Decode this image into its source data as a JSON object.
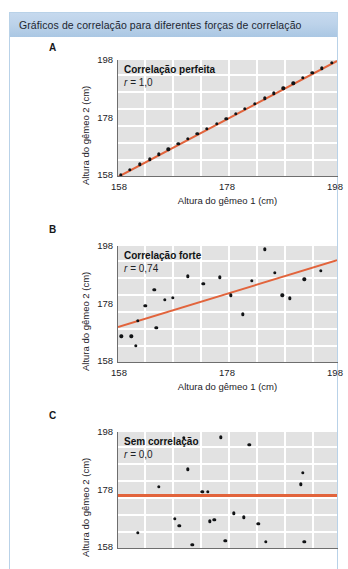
{
  "figure": {
    "title": "Gráficos de correlação para diferentes forças de correlação",
    "accent_band_color": "#bdd3ea",
    "frame_border_color": "#b9d2e8",
    "plot_background_color": "#e2e2e2",
    "gridline_color": "#ffffff",
    "point_color": "#111315",
    "trendline_color": "#e2643c"
  },
  "axes_common": {
    "x_title": "Altura do gêmeo 1 (cm)",
    "y_title": "Altura do gêmeo 2 (cm)",
    "x_ticks": [
      "158",
      "178",
      "198"
    ],
    "y_ticks": [
      "198",
      "178",
      "158"
    ],
    "x_min": 158,
    "x_max": 198,
    "y_min": 158,
    "y_max": 198
  },
  "panels": [
    {
      "letter": "A",
      "title": "Correlação perfeita",
      "r_label": "r",
      "r_value": "= 1,0"
    },
    {
      "letter": "B",
      "title": "Correlação forte",
      "r_label": "r",
      "r_value": "= 0,74"
    },
    {
      "letter": "C",
      "title": "Sem correlação",
      "r_label": "r",
      "r_value": "= 0,0"
    }
  ],
  "chart_data": [
    {
      "type": "scatter",
      "panel": "A",
      "title": "Correlação perfeita",
      "annotation": "r = 1,0",
      "r": 1.0,
      "xlabel": "Altura do gêmeo 1 (cm)",
      "ylabel": "Altura do gêmeo 2 (cm)",
      "xlim": [
        158,
        198
      ],
      "ylim": [
        158,
        198
      ],
      "xticks": [
        158,
        178,
        198
      ],
      "yticks": [
        158,
        178,
        198
      ],
      "grid": true,
      "legend": "none",
      "trendline": {
        "type": "line",
        "x": [
          158,
          198
        ],
        "y": [
          158,
          198
        ],
        "color": "#e2643c"
      },
      "points": [
        {
          "x": 158.5,
          "y": 158.5
        },
        {
          "x": 160.2,
          "y": 160.2
        },
        {
          "x": 162.0,
          "y": 162.0
        },
        {
          "x": 163.8,
          "y": 163.8
        },
        {
          "x": 165.5,
          "y": 165.5
        },
        {
          "x": 167.2,
          "y": 167.2
        },
        {
          "x": 169.0,
          "y": 169.0
        },
        {
          "x": 170.8,
          "y": 170.8
        },
        {
          "x": 172.5,
          "y": 172.5
        },
        {
          "x": 174.2,
          "y": 174.2
        },
        {
          "x": 176.0,
          "y": 176.0
        },
        {
          "x": 177.8,
          "y": 177.8
        },
        {
          "x": 179.5,
          "y": 179.5
        },
        {
          "x": 181.2,
          "y": 181.2
        },
        {
          "x": 183.0,
          "y": 183.0
        },
        {
          "x": 184.8,
          "y": 184.8
        },
        {
          "x": 186.5,
          "y": 186.5
        },
        {
          "x": 188.2,
          "y": 188.2
        },
        {
          "x": 190.0,
          "y": 190.0
        },
        {
          "x": 191.8,
          "y": 191.8
        },
        {
          "x": 193.5,
          "y": 193.5
        },
        {
          "x": 195.2,
          "y": 195.2
        },
        {
          "x": 197.0,
          "y": 197.0
        }
      ]
    },
    {
      "type": "scatter",
      "panel": "B",
      "title": "Correlação forte",
      "annotation": "r = 0,74",
      "r": 0.74,
      "xlabel": "Altura do gêmeo 1 (cm)",
      "ylabel": "Altura do gêmeo 2 (cm)",
      "xlim": [
        158,
        198
      ],
      "ylim": [
        158,
        198
      ],
      "xticks": [
        158,
        178,
        198
      ],
      "yticks": [
        158,
        178,
        198
      ],
      "grid": true,
      "legend": "none",
      "trendline": {
        "type": "line",
        "x": [
          158,
          198
        ],
        "y": [
          170.5,
          193.5
        ],
        "color": "#e2643c"
      },
      "points": [
        {
          "x": 158.6,
          "y": 166.8
        },
        {
          "x": 160.4,
          "y": 166.9
        },
        {
          "x": 161.2,
          "y": 163.6
        },
        {
          "x": 161.6,
          "y": 172.3
        },
        {
          "x": 163.0,
          "y": 177.3
        },
        {
          "x": 164.6,
          "y": 183.0
        },
        {
          "x": 165.0,
          "y": 169.8
        },
        {
          "x": 166.6,
          "y": 179.5
        },
        {
          "x": 168.0,
          "y": 180.2
        },
        {
          "x": 170.8,
          "y": 187.5
        },
        {
          "x": 173.6,
          "y": 185.0
        },
        {
          "x": 176.6,
          "y": 187.2
        },
        {
          "x": 178.6,
          "y": 181.0
        },
        {
          "x": 180.8,
          "y": 174.5
        },
        {
          "x": 182.4,
          "y": 186.0
        },
        {
          "x": 184.8,
          "y": 196.8
        },
        {
          "x": 186.6,
          "y": 188.8
        },
        {
          "x": 188.0,
          "y": 181.0
        },
        {
          "x": 189.4,
          "y": 180.0
        },
        {
          "x": 192.0,
          "y": 186.5
        },
        {
          "x": 195.0,
          "y": 189.5
        }
      ]
    },
    {
      "type": "scatter",
      "panel": "C",
      "title": "Sem correlação",
      "annotation": "r = 0,0",
      "r": 0.0,
      "xlabel": "Altura do gêmeo 1 (cm)",
      "ylabel": "Altura do gêmeo 2 (cm)",
      "xlim": [
        158,
        198
      ],
      "ylim": [
        158,
        198
      ],
      "xticks": [
        158,
        178,
        198
      ],
      "yticks": [
        158,
        178,
        198
      ],
      "grid": true,
      "legend": "none",
      "trendline": {
        "type": "line",
        "x": [
          158,
          198
        ],
        "y": [
          176.5,
          176.5
        ],
        "color": "#e2643c"
      },
      "points": [
        {
          "x": 161.6,
          "y": 163.2
        },
        {
          "x": 165.4,
          "y": 179.2
        },
        {
          "x": 168.4,
          "y": 168.0
        },
        {
          "x": 169.2,
          "y": 165.6
        },
        {
          "x": 170.0,
          "y": 196.0
        },
        {
          "x": 170.8,
          "y": 185.2
        },
        {
          "x": 171.6,
          "y": 159.0
        },
        {
          "x": 173.4,
          "y": 177.4
        },
        {
          "x": 174.4,
          "y": 177.4
        },
        {
          "x": 174.8,
          "y": 167.2
        },
        {
          "x": 175.6,
          "y": 167.8
        },
        {
          "x": 176.8,
          "y": 196.2
        },
        {
          "x": 177.6,
          "y": 160.4
        },
        {
          "x": 179.2,
          "y": 170.0
        },
        {
          "x": 181.0,
          "y": 168.6
        },
        {
          "x": 182.0,
          "y": 193.6
        },
        {
          "x": 183.6,
          "y": 166.4
        },
        {
          "x": 185.0,
          "y": 160.2
        },
        {
          "x": 191.4,
          "y": 180.0
        },
        {
          "x": 191.8,
          "y": 184.0
        },
        {
          "x": 192.0,
          "y": 160.2
        }
      ]
    }
  ]
}
